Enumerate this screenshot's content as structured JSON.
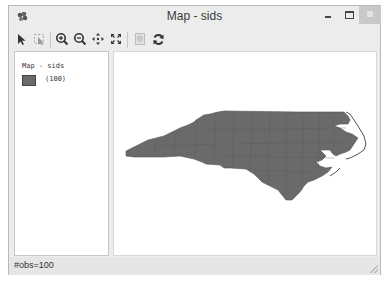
{
  "window": {
    "title": "Map - sids",
    "controls": [
      "minimize",
      "maximize",
      "close"
    ]
  },
  "toolbar": {
    "buttons": [
      {
        "name": "select-tool",
        "icon": "arrow-pointer-icon",
        "enabled": true
      },
      {
        "name": "select-by-region",
        "icon": "select-region-icon",
        "enabled": false
      },
      {
        "name": "zoom-in",
        "icon": "zoom-in-icon",
        "enabled": true
      },
      {
        "name": "zoom-out",
        "icon": "zoom-out-icon",
        "enabled": true
      },
      {
        "name": "pan",
        "icon": "pan-icon",
        "enabled": true
      },
      {
        "name": "full-extent",
        "icon": "full-extent-icon",
        "enabled": true
      },
      {
        "name": "layer-properties",
        "icon": "layer-icon",
        "enabled": false
      },
      {
        "name": "refresh",
        "icon": "refresh-icon",
        "enabled": true
      }
    ]
  },
  "legend": {
    "title": "Map - sids",
    "items": [
      {
        "label": "(100)",
        "color": "#6a6a6a"
      }
    ]
  },
  "map": {
    "layer": "sids",
    "fill_color": "#6a6a6a",
    "border_color": "#555555",
    "feature_count": 100
  },
  "status": {
    "text": "#obs=100"
  }
}
